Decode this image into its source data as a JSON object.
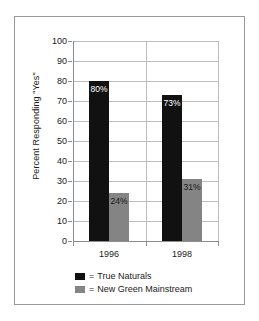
{
  "chart_data": {
    "type": "bar",
    "title": "",
    "xlabel": "",
    "ylabel": "Percent Responding \"Yes\"",
    "categories": [
      "1996",
      "1998"
    ],
    "series": [
      {
        "name": "True Naturals",
        "color": "#111111",
        "values": [
          80,
          73
        ],
        "labels": [
          "80%",
          "73%"
        ]
      },
      {
        "name": "New Green Mainstream",
        "color": "#848484",
        "values": [
          24,
          31
        ],
        "labels": [
          "24%",
          "31%"
        ]
      }
    ],
    "ylim": [
      0,
      100
    ],
    "ytick_step": 10,
    "yticks": [
      0,
      10,
      20,
      30,
      40,
      50,
      60,
      70,
      80,
      90,
      100
    ],
    "ytick_labels": [
      "0",
      "10",
      "20",
      "30",
      "40",
      "50",
      "60",
      "70",
      "80",
      "90",
      "100"
    ],
    "grid": true,
    "legend_position": "bottom-center",
    "legend_separator": "="
  },
  "legend": {
    "entries": [
      {
        "separator": "=",
        "label": "True Naturals"
      },
      {
        "separator": "=",
        "label": "New Green Mainstream"
      }
    ]
  }
}
